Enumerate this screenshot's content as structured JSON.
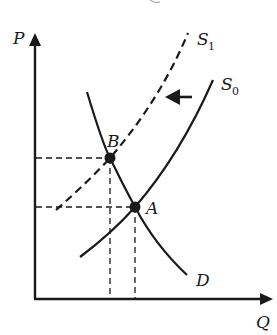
{
  "diagram": {
    "type": "supply-demand-shift",
    "axes": {
      "y_label": "P",
      "x_label": "Q"
    },
    "curves": {
      "demand": {
        "label": "D",
        "style": "solid"
      },
      "supply_original": {
        "label": "S",
        "subscript": "0",
        "style": "solid"
      },
      "supply_new": {
        "label": "S",
        "subscript": "1",
        "style": "dashed"
      }
    },
    "points": {
      "original_equilibrium": {
        "label": "A"
      },
      "new_equilibrium": {
        "label": "B"
      }
    },
    "shift_arrow": {
      "direction": "left",
      "icon": "arrow-left-icon"
    },
    "colors": {
      "ink": "#1a1a1a",
      "background": "#ffffff"
    }
  }
}
